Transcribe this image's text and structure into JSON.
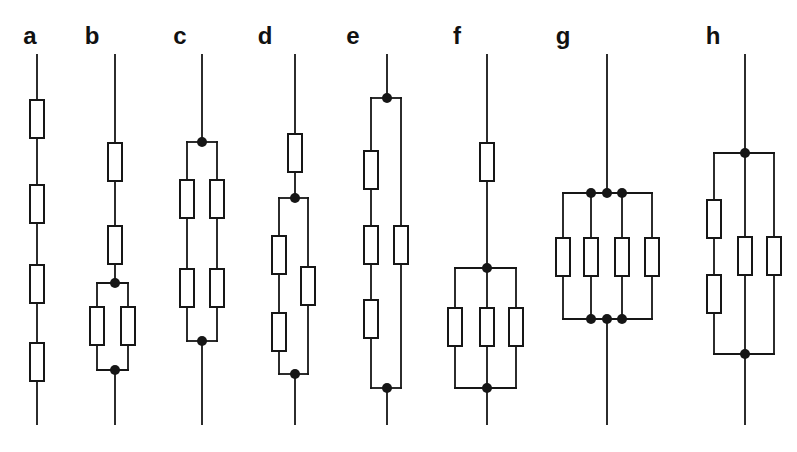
{
  "figure": {
    "width": 797,
    "height": 452,
    "background": "#ffffff",
    "ink_color": "#161616",
    "wire_width": 1.8,
    "resistor_width": 14,
    "resistor_height": 38,
    "resistor_fill": "#ffffff",
    "resistor_stroke_width": 2,
    "dot_radius": 5,
    "label_top": 24,
    "label_font_size": 24
  },
  "circuits": [
    {
      "label": "a",
      "topology": "four resistors in series",
      "label_x": 30,
      "wires": [
        [
          37,
          55,
          37,
          424
        ]
      ],
      "resistors": [
        [
          37,
          100
        ],
        [
          37,
          185
        ],
        [
          37,
          265
        ],
        [
          37,
          343
        ]
      ],
      "dots": []
    },
    {
      "label": "b",
      "topology": "two resistors in series followed by two resistors in parallel",
      "label_x": 92,
      "wires": [
        [
          115,
          55,
          115,
          283
        ],
        [
          115,
          370,
          115,
          424
        ],
        [
          97,
          283,
          128,
          283
        ],
        [
          97,
          370,
          128,
          370
        ],
        [
          97,
          283,
          97,
          370
        ],
        [
          128,
          283,
          128,
          370
        ]
      ],
      "resistors": [
        [
          115,
          143
        ],
        [
          115,
          226
        ],
        [
          97,
          307
        ],
        [
          128,
          307
        ]
      ],
      "dots": [
        [
          115,
          283
        ],
        [
          115,
          370
        ]
      ]
    },
    {
      "label": "c",
      "topology": "two parallel branches, each with two resistors in series",
      "label_x": 180,
      "wires": [
        [
          202,
          55,
          202,
          142
        ],
        [
          202,
          341,
          202,
          424
        ],
        [
          187,
          142,
          217,
          142
        ],
        [
          187,
          341,
          217,
          341
        ],
        [
          187,
          142,
          187,
          341
        ],
        [
          217,
          142,
          217,
          341
        ]
      ],
      "resistors": [
        [
          187,
          180
        ],
        [
          217,
          180
        ],
        [
          187,
          269
        ],
        [
          217,
          269
        ]
      ],
      "dots": [
        [
          202,
          142
        ],
        [
          202,
          341
        ]
      ]
    },
    {
      "label": "d",
      "topology": "one series resistor followed by parallel combination of two-in-series and one resistor",
      "label_x": 265,
      "wires": [
        [
          295,
          55,
          295,
          198
        ],
        [
          295,
          374,
          295,
          424
        ],
        [
          279,
          198,
          308,
          198
        ],
        [
          279,
          374,
          308,
          374
        ],
        [
          279,
          198,
          279,
          374
        ],
        [
          308,
          198,
          308,
          374
        ]
      ],
      "resistors": [
        [
          295,
          134
        ],
        [
          279,
          236
        ],
        [
          279,
          313
        ],
        [
          308,
          267
        ]
      ],
      "dots": [
        [
          295,
          198
        ],
        [
          295,
          374
        ]
      ]
    },
    {
      "label": "e",
      "topology": "parallel combination of three-in-series branch and single resistor branch",
      "label_x": 353,
      "wires": [
        [
          387,
          55,
          387,
          98
        ],
        [
          387,
          388,
          387,
          424
        ],
        [
          371,
          98,
          401,
          98
        ],
        [
          371,
          388,
          401,
          388
        ],
        [
          371,
          98,
          371,
          388
        ],
        [
          401,
          98,
          401,
          388
        ]
      ],
      "resistors": [
        [
          371,
          151
        ],
        [
          371,
          226
        ],
        [
          371,
          300
        ],
        [
          401,
          226
        ]
      ],
      "dots": [
        [
          387,
          98
        ],
        [
          387,
          388
        ]
      ]
    },
    {
      "label": "f",
      "topology": "one series resistor followed by three resistors in parallel",
      "label_x": 457,
      "wires": [
        [
          487,
          55,
          487,
          268
        ],
        [
          487,
          388,
          487,
          424
        ],
        [
          455,
          268,
          516,
          268
        ],
        [
          455,
          388,
          516,
          388
        ],
        [
          455,
          268,
          455,
          388
        ],
        [
          487,
          268,
          487,
          388
        ],
        [
          516,
          268,
          516,
          388
        ]
      ],
      "resistors": [
        [
          487,
          143
        ],
        [
          455,
          308
        ],
        [
          487,
          308
        ],
        [
          516,
          308
        ]
      ],
      "dots": [
        [
          487,
          268
        ],
        [
          487,
          388
        ]
      ]
    },
    {
      "label": "g",
      "topology": "four resistors in parallel with triple junction dots on each rail",
      "label_x": 563,
      "wires": [
        [
          607,
          55,
          607,
          193
        ],
        [
          607,
          319,
          607,
          424
        ],
        [
          563,
          193,
          652,
          193
        ],
        [
          563,
          319,
          652,
          319
        ],
        [
          563,
          193,
          563,
          319
        ],
        [
          591,
          193,
          591,
          319
        ],
        [
          622,
          193,
          622,
          319
        ],
        [
          652,
          193,
          652,
          319
        ]
      ],
      "resistors": [
        [
          563,
          238
        ],
        [
          591,
          238
        ],
        [
          622,
          238
        ],
        [
          652,
          238
        ]
      ],
      "dots": [
        [
          591,
          193
        ],
        [
          607,
          193
        ],
        [
          622,
          193
        ],
        [
          591,
          319
        ],
        [
          607,
          319
        ],
        [
          622,
          319
        ]
      ]
    },
    {
      "label": "h",
      "topology": "parallel combination of two-in-series branch, middle single resistor and right single resistor",
      "label_x": 713,
      "wires": [
        [
          745,
          55,
          745,
          153
        ],
        [
          745,
          354,
          745,
          424
        ],
        [
          714,
          153,
          774,
          153
        ],
        [
          714,
          354,
          774,
          354
        ],
        [
          714,
          153,
          714,
          354
        ],
        [
          745,
          153,
          745,
          354
        ],
        [
          774,
          153,
          774,
          354
        ]
      ],
      "resistors": [
        [
          714,
          200
        ],
        [
          714,
          275
        ],
        [
          745,
          237
        ],
        [
          774,
          237
        ]
      ],
      "dots": [
        [
          745,
          153
        ],
        [
          745,
          354
        ]
      ]
    }
  ]
}
